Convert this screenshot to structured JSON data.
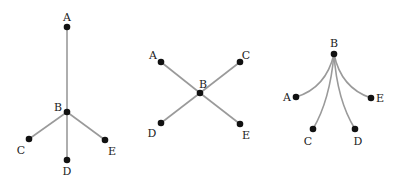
{
  "diagrams": [
    {
      "name": "tree-vertical-star",
      "center": "B",
      "nodes": [
        "A",
        "B",
        "C",
        "D",
        "E"
      ],
      "edges": [
        [
          "A",
          "B"
        ],
        [
          "B",
          "C"
        ],
        [
          "B",
          "D"
        ],
        [
          "B",
          "E"
        ]
      ],
      "edge_style": "straight"
    },
    {
      "name": "x-star",
      "center": "B",
      "nodes": [
        "A",
        "C",
        "B",
        "D",
        "E"
      ],
      "edges": [
        [
          "A",
          "B"
        ],
        [
          "C",
          "B"
        ],
        [
          "B",
          "D"
        ],
        [
          "B",
          "E"
        ]
      ],
      "edge_style": "straight"
    },
    {
      "name": "fan-star",
      "center": "B",
      "nodes": [
        "B",
        "A",
        "E",
        "C",
        "D"
      ],
      "edges": [
        [
          "B",
          "A"
        ],
        [
          "B",
          "E"
        ],
        [
          "B",
          "C"
        ],
        [
          "B",
          "D"
        ]
      ],
      "edge_style": "curved"
    }
  ],
  "labels": {
    "d1": {
      "A": "A",
      "B": "B",
      "C": "C",
      "D": "D",
      "E": "E"
    },
    "d2": {
      "A": "A",
      "B": "B",
      "C": "C",
      "D": "D",
      "E": "E"
    },
    "d3": {
      "A": "A",
      "B": "B",
      "C": "C",
      "D": "D",
      "E": "E"
    }
  },
  "colors": {
    "edge": "#9a9a9a",
    "node": "#111111",
    "label": "#222222"
  }
}
